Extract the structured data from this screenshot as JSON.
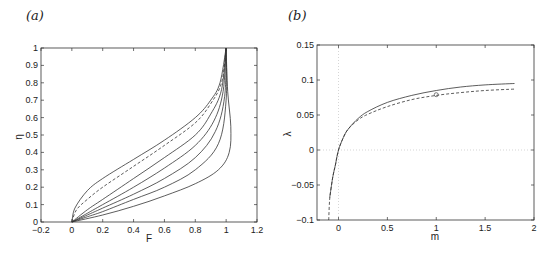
{
  "chart_data": [
    {
      "panel": "(a)",
      "type": "line",
      "xlabel": "F",
      "ylabel": "η",
      "xlim": [
        -0.2,
        1.2
      ],
      "ylim": [
        0,
        1
      ],
      "xticks": [
        "-0.2",
        "0",
        "0.2",
        "0.4",
        "0.6",
        "0.8",
        "1",
        "1.2"
      ],
      "yticks": [
        "0",
        "0.1",
        "0.2",
        "0.3",
        "0.4",
        "0.5",
        "0.6",
        "0.7",
        "0.8",
        "0.9",
        "1"
      ],
      "grid": false,
      "series": [
        {
          "name": "curve1",
          "style": "solid",
          "x": [
            0,
            0.02,
            0.1,
            0.2,
            0.4,
            0.6,
            0.8,
            0.9,
            0.96,
            1.0
          ],
          "y": [
            0,
            0.08,
            0.18,
            0.25,
            0.36,
            0.47,
            0.6,
            0.7,
            0.8,
            1.0
          ]
        },
        {
          "name": "dashed",
          "style": "dashed",
          "x": [
            0,
            0.03,
            0.1,
            0.2,
            0.4,
            0.6,
            0.8,
            0.9,
            0.97,
            1.0
          ],
          "y": [
            0,
            0.07,
            0.13,
            0.2,
            0.32,
            0.44,
            0.57,
            0.68,
            0.8,
            1.0
          ]
        },
        {
          "name": "curve2",
          "style": "solid",
          "x": [
            0,
            0.1,
            0.2,
            0.4,
            0.6,
            0.8,
            0.9,
            0.97,
            1.0
          ],
          "y": [
            0,
            0.07,
            0.13,
            0.25,
            0.37,
            0.5,
            0.62,
            0.76,
            1.0
          ]
        },
        {
          "name": "curve3",
          "style": "solid",
          "x": [
            0,
            0.1,
            0.2,
            0.4,
            0.6,
            0.8,
            0.92,
            0.98,
            1.0
          ],
          "y": [
            0,
            0.05,
            0.1,
            0.2,
            0.31,
            0.44,
            0.58,
            0.75,
            1.0
          ]
        },
        {
          "name": "curve4",
          "style": "solid",
          "x": [
            0,
            0.1,
            0.2,
            0.4,
            0.6,
            0.8,
            0.93,
            0.99,
            1.0
          ],
          "y": [
            0,
            0.04,
            0.08,
            0.16,
            0.25,
            0.37,
            0.52,
            0.72,
            1.0
          ]
        },
        {
          "name": "curve5",
          "style": "solid",
          "x": [
            0,
            0.1,
            0.2,
            0.4,
            0.6,
            0.8,
            0.95,
            1.0,
            1.0
          ],
          "y": [
            0,
            0.03,
            0.06,
            0.13,
            0.2,
            0.3,
            0.45,
            0.7,
            1.0
          ]
        },
        {
          "name": "curve6",
          "style": "solid",
          "x": [
            0,
            0.2,
            0.4,
            0.6,
            0.8,
            0.95,
            1.02,
            1.03,
            1.01,
            1.0
          ],
          "y": [
            0,
            0.04,
            0.09,
            0.15,
            0.22,
            0.3,
            0.4,
            0.55,
            0.75,
            1.0
          ]
        }
      ]
    },
    {
      "panel": "(b)",
      "type": "line",
      "xlabel": "m",
      "ylabel": "λ",
      "xlim": [
        -0.22,
        2
      ],
      "ylim": [
        -0.1,
        0.15
      ],
      "xticks": [
        "0",
        "0.5",
        "1",
        "1.5",
        "2"
      ],
      "yticks": [
        "-0.1",
        "-0.05",
        "0",
        "0.05",
        "0.1",
        "0.15"
      ],
      "grid": "dotted zero lines",
      "series": [
        {
          "name": "solid",
          "style": "solid",
          "x": [
            -0.09,
            -0.06,
            -0.03,
            0,
            0.05,
            0.1,
            0.2,
            0.3,
            0.5,
            0.75,
            1.0,
            1.25,
            1.5,
            1.8
          ],
          "y": [
            -0.068,
            -0.04,
            -0.02,
            0.0,
            0.018,
            0.03,
            0.045,
            0.055,
            0.068,
            0.078,
            0.085,
            0.09,
            0.093,
            0.095
          ]
        },
        {
          "name": "dashed",
          "style": "dashed",
          "x": [
            -0.1,
            -0.09,
            -0.06,
            -0.03,
            0,
            0.05,
            0.1,
            0.2,
            0.3,
            0.5,
            0.75,
            1.0,
            1.25,
            1.5,
            1.8
          ],
          "y": [
            -0.1,
            -0.07,
            -0.04,
            -0.02,
            0.0,
            0.018,
            0.03,
            0.043,
            0.051,
            0.062,
            0.072,
            0.078,
            0.082,
            0.085,
            0.087
          ]
        }
      ],
      "markers": [
        {
          "x": 1.0,
          "y": 0.079,
          "shape": "circle"
        }
      ]
    }
  ]
}
